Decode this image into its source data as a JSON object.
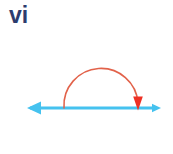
{
  "figure": {
    "label": "vi",
    "label_color": "#2c3c6e",
    "background_color": "#ffffff",
    "width": 173,
    "height": 154
  },
  "number_line": {
    "name": "horizontal-number-line",
    "color": "#45c2ef",
    "stroke_width": 3,
    "y": 108,
    "x_start": 27,
    "x_end": 161,
    "left_arrowhead": {
      "direction": "left",
      "tip_x": 27,
      "size": 11,
      "color": "#45c2ef"
    },
    "right_arrowhead": {
      "direction": "right",
      "tip_x": 161,
      "size": 7,
      "color": "#45c2ef"
    }
  },
  "arc": {
    "name": "semicircular-rotation-arc",
    "color": "#e2624a",
    "stroke_width": 1.6,
    "center_x": 101,
    "center_y": 108,
    "radius": 37,
    "start_x": 64,
    "start_y": 108,
    "end_x": 138,
    "end_y": 103,
    "apex_y": 69,
    "sweep": "clockwise-over-the-top",
    "arrowhead": {
      "direction": "down",
      "tip_x": 138,
      "tip_y": 110,
      "width": 10,
      "height": 14,
      "color": "#ee3124"
    }
  }
}
